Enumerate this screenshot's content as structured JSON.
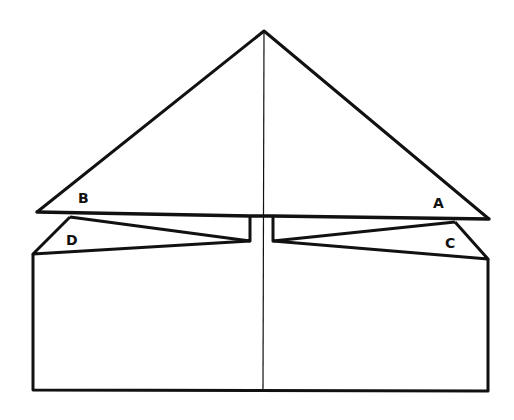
{
  "diagram": {
    "type": "origami-fold-diagram",
    "stroke_color": "#111111",
    "background": "#ffffff",
    "labels": {
      "A": "A",
      "B": "B",
      "C": "C",
      "D": "D"
    }
  }
}
